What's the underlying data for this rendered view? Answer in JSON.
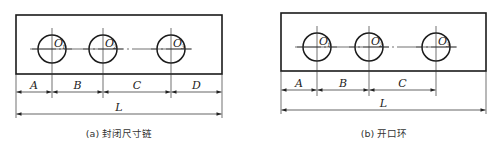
{
  "diagrams": [
    {
      "id": "a",
      "caption": "(a) 封闭尺寸链",
      "rect": {
        "x": 16,
        "y": 15,
        "w": 206,
        "h": 59
      },
      "hole_y": 49,
      "hole_r": 14,
      "holes": [
        {
          "x": 52,
          "label": "O",
          "sub": "1"
        },
        {
          "x": 103,
          "label": "O",
          "sub": "2"
        },
        {
          "x": 171,
          "label": "O",
          "sub": "3"
        }
      ],
      "chain_y": 92,
      "chain": [
        {
          "label": "A",
          "from": 16,
          "to": 52
        },
        {
          "label": "B",
          "from": 52,
          "to": 103
        },
        {
          "label": "C",
          "from": 103,
          "to": 171
        },
        {
          "label": "D",
          "from": 171,
          "to": 222
        }
      ],
      "total": {
        "label": "L",
        "from": 16,
        "to": 222,
        "y": 114
      }
    },
    {
      "id": "b",
      "caption": "(b) 开口环",
      "rect": {
        "x": 281,
        "y": 13,
        "w": 205,
        "h": 58
      },
      "hole_y": 47,
      "hole_r": 14,
      "holes": [
        {
          "x": 317,
          "label": "O",
          "sub": "1"
        },
        {
          "x": 369,
          "label": "O",
          "sub": "2"
        },
        {
          "x": 436,
          "label": "O",
          "sub": "3"
        }
      ],
      "chain_y": 90,
      "chain": [
        {
          "label": "A",
          "from": 281,
          "to": 317
        },
        {
          "label": "B",
          "from": 317,
          "to": 369
        },
        {
          "label": "C",
          "from": 369,
          "to": 436
        }
      ],
      "total": {
        "label": "L",
        "from": 281,
        "to": 486,
        "y": 110
      }
    }
  ],
  "colors": {
    "line": "#1a1a1a",
    "thin": "#333333"
  }
}
